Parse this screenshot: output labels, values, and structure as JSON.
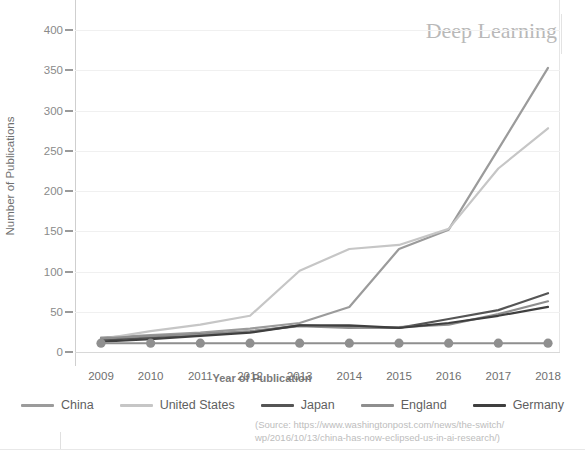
{
  "title": "Deep Learning",
  "axis": {
    "ylabel": "Number of Publications",
    "xlabel": "Year of Publication"
  },
  "source": {
    "line1": "(Source: https://www.washingtonpost.com/news/the-switch/",
    "line2": "wp/2016/10/13/china-has-now-eclipsed-us-in-ai-research/)"
  },
  "colors": {
    "china": "#9b9b9b",
    "united_states": "#c6c6c6",
    "japan": "#555555",
    "england": "#8e8e8e",
    "germany": "#3f3f3f",
    "marker_series": "#8f8f8f",
    "grid": "#f0f0f0",
    "axis": "#cfcfcf",
    "title": "#b9b9b9"
  },
  "chart_data": {
    "type": "line",
    "title": "Deep Learning",
    "xlabel": "Year of Publication",
    "ylabel": "Number of Publications",
    "x": [
      2009,
      2010,
      2011,
      2012,
      2013,
      2014,
      2015,
      2016,
      2017,
      2018
    ],
    "xtick_labels": [
      "2009",
      "2010",
      "2011",
      "2012",
      "2013",
      "2014",
      "2015",
      "2016",
      "2017",
      "2018"
    ],
    "ytick_labels": [
      "0",
      "50",
      "100",
      "150",
      "200",
      "250",
      "300",
      "350",
      "400"
    ],
    "ytick_values": [
      0,
      50,
      100,
      150,
      200,
      250,
      300,
      350,
      400
    ],
    "ylim": [
      0,
      420
    ],
    "xlim": [
      2009,
      2018
    ],
    "grid": true,
    "legend_position": "bottom",
    "series": [
      {
        "name": "China",
        "color": "#9b9b9b",
        "values": [
          18,
          21,
          24,
          29,
          36,
          56,
          128,
          152,
          252,
          353
        ]
      },
      {
        "name": "United States",
        "color": "#c6c6c6",
        "values": [
          16,
          26,
          34,
          45,
          101,
          128,
          133,
          153,
          228,
          278
        ]
      },
      {
        "name": "Japan",
        "color": "#555555",
        "values": [
          15,
          18,
          22,
          25,
          33,
          31,
          30,
          41,
          52,
          73
        ]
      },
      {
        "name": "England",
        "color": "#8e8e8e",
        "values": [
          17,
          20,
          22,
          26,
          32,
          30,
          31,
          34,
          47,
          63
        ]
      },
      {
        "name": "Germany",
        "color": "#3f3f3f",
        "values": [
          13,
          16,
          20,
          24,
          33,
          33,
          30,
          36,
          45,
          56
        ]
      },
      {
        "name": "Baseline",
        "color": "#8f8f8f",
        "markers": true,
        "values": [
          11,
          11,
          11,
          11,
          11,
          11,
          11,
          11,
          11,
          11
        ]
      }
    ],
    "legend": [
      "China",
      "United States",
      "Japan",
      "England",
      "Germany"
    ]
  }
}
